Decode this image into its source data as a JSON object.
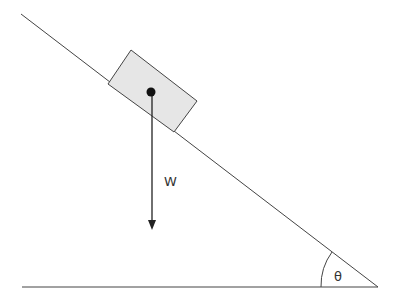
{
  "diagram": {
    "title": "",
    "labels": {
      "weight": "W",
      "angle": "θ"
    },
    "colors": {
      "line": "#444444",
      "block_fill": "#e6e6e6",
      "block_stroke": "#444444",
      "dot": "#111111",
      "arrow": "#222222"
    },
    "elements": [
      "inclined-plane",
      "ground-line",
      "block",
      "center-of-mass-dot",
      "weight-arrow",
      "angle-arc"
    ]
  }
}
